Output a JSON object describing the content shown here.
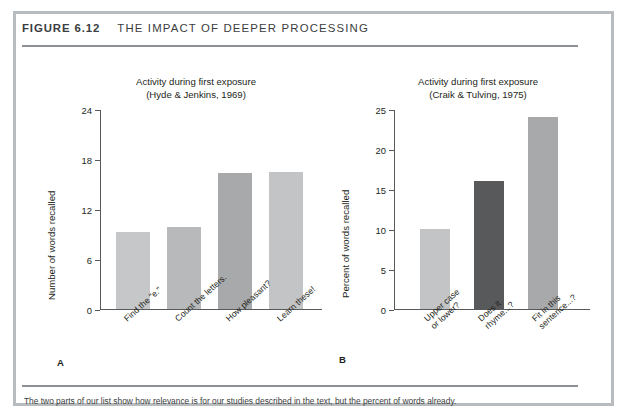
{
  "figure": {
    "number": "FIGURE 6.12",
    "title": "THE IMPACT OF DEEPER PROCESSING",
    "caption": "The two parts of our list show how relevance is for our studies described in the text, but the percent of words already."
  },
  "panels": {
    "a": {
      "letter": "A"
    },
    "b": {
      "letter": "B"
    }
  },
  "chart_data": [
    {
      "type": "bar",
      "panel": "A",
      "title": "Activity during first exposure",
      "subtitle": "(Hyde & Jenkins, 1969)",
      "xlabel": "",
      "ylabel": "Number of words recalled",
      "ylim": [
        0,
        24
      ],
      "yticks": [
        0,
        6,
        12,
        18,
        24
      ],
      "ytick_labels": [
        "0",
        "6",
        "12",
        "18",
        "24"
      ],
      "grid": false,
      "legend": "none",
      "categories": [
        "Find the \"e.\"",
        "Count the letters.",
        "How pleasant?",
        "Learn these!"
      ],
      "values": [
        9.3,
        9.9,
        16.3,
        16.5
      ],
      "colors": [
        "#c6c7c8",
        "#b8b9ba",
        "#a7a9ab",
        "#c3c4c5"
      ]
    },
    {
      "type": "bar",
      "panel": "B",
      "title": "Activity during first exposure",
      "subtitle": "(Craik & Tulving, 1975)",
      "xlabel": "",
      "ylabel": "Percent of words recalled",
      "ylim": [
        0,
        25
      ],
      "yticks": [
        0,
        5,
        10,
        15,
        20,
        25
      ],
      "ytick_labels": [
        "0",
        "5",
        "10",
        "15",
        "20",
        "25"
      ],
      "grid": false,
      "legend": "none",
      "categories_lines": [
        [
          "Upper case",
          "or lower?"
        ],
        [
          "Does it",
          "rhyme...?"
        ],
        [
          "Fit in this",
          "sentence...?"
        ]
      ],
      "values": [
        10,
        16,
        24
      ],
      "colors": [
        "#c3c4c5",
        "#58595b",
        "#a7a9ab"
      ]
    }
  ]
}
